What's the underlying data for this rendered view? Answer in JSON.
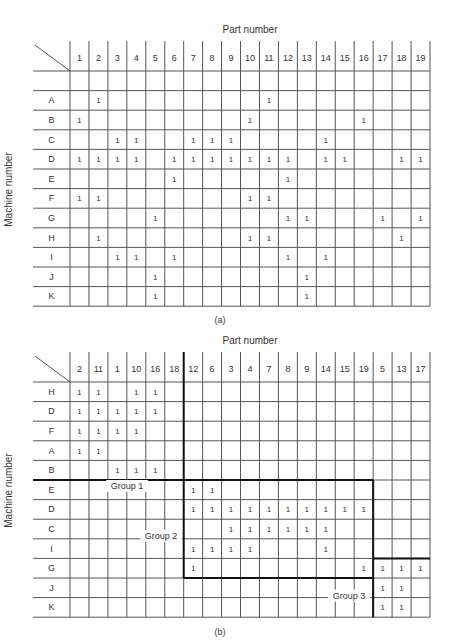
{
  "figure_a": {
    "x_title": "Part number",
    "y_title": "Machine number",
    "caption": "(a)",
    "columns": [
      "1",
      "2",
      "3",
      "4",
      "5",
      "6",
      "7",
      "8",
      "9",
      "10",
      "11",
      "12",
      "13",
      "14",
      "15",
      "16",
      "17",
      "18",
      "19"
    ],
    "has_blank_row": true,
    "rows": [
      {
        "machine": "A",
        "parts": [
          "2",
          "11"
        ]
      },
      {
        "machine": "B",
        "parts": [
          "1",
          "10",
          "16"
        ]
      },
      {
        "machine": "C",
        "parts": [
          "3",
          "4",
          "7",
          "8",
          "9",
          "14"
        ]
      },
      {
        "machine": "D",
        "parts": [
          "1",
          "2",
          "3",
          "4",
          "6",
          "7",
          "8",
          "9",
          "10",
          "11",
          "12",
          "14",
          "15",
          "18",
          "19"
        ]
      },
      {
        "machine": "E",
        "parts": [
          "6",
          "12"
        ]
      },
      {
        "machine": "F",
        "parts": [
          "1",
          "2",
          "10",
          "11"
        ]
      },
      {
        "machine": "G",
        "parts": [
          "5",
          "12",
          "13",
          "17",
          "19"
        ]
      },
      {
        "machine": "H",
        "parts": [
          "2",
          "10",
          "11",
          "18"
        ]
      },
      {
        "machine": "I",
        "parts": [
          "3",
          "4",
          "6",
          "12",
          "14"
        ]
      },
      {
        "machine": "J",
        "parts": [
          "5",
          "13"
        ]
      },
      {
        "machine": "K",
        "parts": [
          "5",
          "13"
        ]
      }
    ]
  },
  "figure_b": {
    "x_title": "Part number",
    "y_title": "Machine number",
    "caption": "(b)",
    "columns": [
      "2",
      "11",
      "1",
      "10",
      "16",
      "18",
      "12",
      "6",
      "3",
      "4",
      "7",
      "8",
      "9",
      "14",
      "15",
      "19",
      "5",
      "13",
      "17"
    ],
    "has_blank_row": false,
    "rows": [
      {
        "machine": "H",
        "parts": [
          "2",
          "11",
          "10",
          "16"
        ]
      },
      {
        "machine": "D",
        "parts": [
          "2",
          "11",
          "1",
          "10",
          "16"
        ]
      },
      {
        "machine": "F",
        "parts": [
          "2",
          "11",
          "1",
          "10"
        ]
      },
      {
        "machine": "A",
        "parts": [
          "2",
          "11"
        ]
      },
      {
        "machine": "B",
        "parts": [
          "1",
          "10",
          "16"
        ]
      },
      {
        "machine": "E",
        "parts": [
          "12",
          "6"
        ]
      },
      {
        "machine": "D",
        "parts": [
          "12",
          "6",
          "3",
          "4",
          "7",
          "8",
          "9",
          "14",
          "15",
          "19"
        ]
      },
      {
        "machine": "C",
        "parts": [
          "3",
          "4",
          "7",
          "8",
          "9",
          "14"
        ]
      },
      {
        "machine": "I",
        "parts": [
          "12",
          "6",
          "3",
          "4",
          "14"
        ]
      },
      {
        "machine": "G",
        "parts": [
          "12",
          "19",
          "5",
          "13",
          "17"
        ]
      },
      {
        "machine": "J",
        "parts": [
          "5",
          "13"
        ]
      },
      {
        "machine": "K",
        "parts": [
          "5",
          "13"
        ]
      }
    ],
    "groups": [
      {
        "label": "Group 1",
        "machines": [
          "H",
          "D",
          "F",
          "A",
          "B"
        ],
        "parts": [
          "2",
          "11",
          "1",
          "10",
          "16",
          "18"
        ]
      },
      {
        "label": "Group 2",
        "machines": [
          "E",
          "D",
          "C",
          "I",
          "G"
        ],
        "parts": [
          "12",
          "6",
          "3",
          "4",
          "7",
          "8",
          "9",
          "14",
          "15",
          "19"
        ]
      },
      {
        "label": "Group 3",
        "machines": [
          "G",
          "J",
          "K"
        ],
        "parts": [
          "5",
          "13",
          "17"
        ]
      }
    ]
  },
  "cell_mark": "1",
  "colors": {
    "line": "#555555",
    "thick_line": "#111111",
    "text": "#333333",
    "background": "#ffffff"
  }
}
